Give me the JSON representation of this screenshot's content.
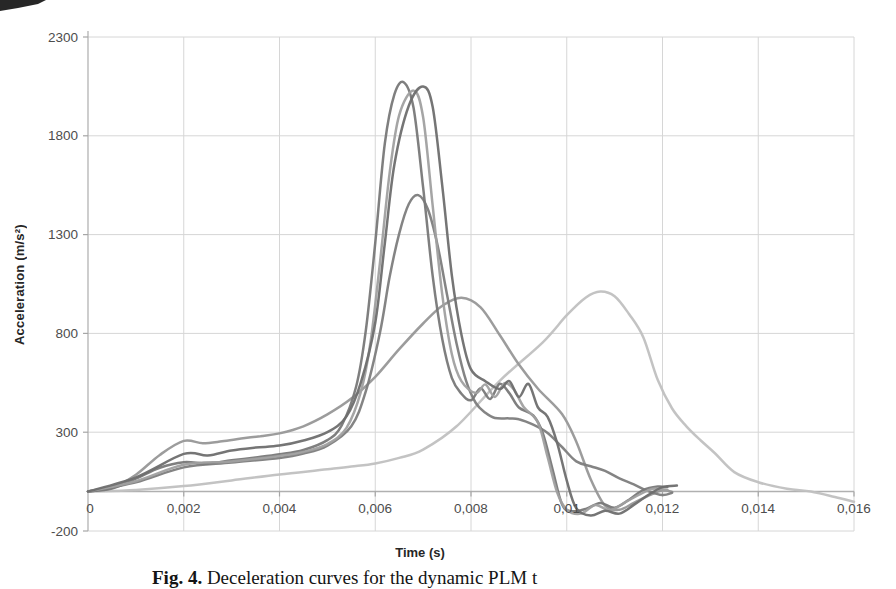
{
  "colors": {
    "background": "#ffffff",
    "grid": "#d6d6d6",
    "axis_line": "#b3b3b3",
    "zero_line": "#b0b0b0",
    "tick_mark": "#a6a6a6",
    "tick_text": "#4d4d4d",
    "axis_title_text": "#262626",
    "caption_text": "#141414",
    "scan_artifact": "#151515"
  },
  "caption": {
    "prefix": "Fig. 4.",
    "text": " Deceleration curves for the dynamic PLM t"
  },
  "chart_data": {
    "type": "line",
    "title": "",
    "xlabel": "Time (s)",
    "ylabel": "Acceleration (m/s²)",
    "xlim": [
      0,
      0.016
    ],
    "ylim": [
      -200,
      2300
    ],
    "grid": true,
    "legend": "none",
    "x_ticks": [
      {
        "value": 0,
        "label": "0"
      },
      {
        "value": 0.002,
        "label": "0,002"
      },
      {
        "value": 0.004,
        "label": "0,004"
      },
      {
        "value": 0.006,
        "label": "0,006"
      },
      {
        "value": 0.008,
        "label": "0,008"
      },
      {
        "value": 0.01,
        "label": "0,01"
      },
      {
        "value": 0.012,
        "label": "0,012"
      },
      {
        "value": 0.014,
        "label": "0,014"
      },
      {
        "value": 0.016,
        "label": "0,016"
      }
    ],
    "y_ticks": [
      {
        "value": -200,
        "label": "-200"
      },
      {
        "value": 300,
        "label": "300"
      },
      {
        "value": 800,
        "label": "800"
      },
      {
        "value": 1300,
        "label": "1300"
      },
      {
        "value": 1800,
        "label": "1800"
      },
      {
        "value": 2300,
        "label": "2300"
      }
    ],
    "series": [
      {
        "name": "curve-6-light-broad",
        "color": "#c0c0c0",
        "points": [
          [
            0,
            0
          ],
          [
            0.001,
            8
          ],
          [
            0.002,
            27
          ],
          [
            0.003,
            56
          ],
          [
            0.004,
            86
          ],
          [
            0.005,
            112
          ],
          [
            0.0055,
            126
          ],
          [
            0.006,
            142
          ],
          [
            0.0065,
            170
          ],
          [
            0.007,
            212
          ],
          [
            0.0077,
            330
          ],
          [
            0.0086,
            560
          ],
          [
            0.0095,
            755
          ],
          [
            0.01,
            892
          ],
          [
            0.0104,
            982
          ],
          [
            0.0107,
            1012
          ],
          [
            0.011,
            988
          ],
          [
            0.0113,
            898
          ],
          [
            0.0116,
            780
          ],
          [
            0.0119,
            565
          ],
          [
            0.0122,
            420
          ],
          [
            0.0125,
            330
          ],
          [
            0.0128,
            258
          ],
          [
            0.0131,
            192
          ],
          [
            0.0135,
            98
          ],
          [
            0.014,
            47
          ],
          [
            0.0146,
            14
          ],
          [
            0.0151,
            0
          ],
          [
            0.0156,
            -28
          ],
          [
            0.016,
            -52
          ]
        ]
      },
      {
        "name": "curve-5-medium-broad",
        "color": "#979797",
        "points": [
          [
            0,
            0
          ],
          [
            0.0005,
            18
          ],
          [
            0.001,
            85
          ],
          [
            0.0015,
            185
          ],
          [
            0.002,
            256
          ],
          [
            0.0024,
            244
          ],
          [
            0.0028,
            254
          ],
          [
            0.0032,
            268
          ],
          [
            0.0036,
            280
          ],
          [
            0.004,
            294
          ],
          [
            0.0045,
            330
          ],
          [
            0.005,
            390
          ],
          [
            0.0055,
            470
          ],
          [
            0.006,
            580
          ],
          [
            0.0065,
            720
          ],
          [
            0.007,
            850
          ],
          [
            0.0074,
            940
          ],
          [
            0.0078,
            980
          ],
          [
            0.0082,
            932
          ],
          [
            0.0086,
            792
          ],
          [
            0.009,
            642
          ],
          [
            0.0094,
            520
          ],
          [
            0.0099,
            392
          ],
          [
            0.0102,
            252
          ],
          [
            0.0105,
            62
          ],
          [
            0.0108,
            -72
          ],
          [
            0.0111,
            -92
          ],
          [
            0.0114,
            -58
          ],
          [
            0.0117,
            -22
          ],
          [
            0.012,
            6
          ],
          [
            0.0122,
            -2
          ]
        ]
      },
      {
        "name": "curve-4-dark-1500",
        "color": "#7d7d7d",
        "points": [
          [
            0,
            0
          ],
          [
            0.001,
            46
          ],
          [
            0.002,
            122
          ],
          [
            0.003,
            146
          ],
          [
            0.004,
            170
          ],
          [
            0.0045,
            192
          ],
          [
            0.005,
            232
          ],
          [
            0.0055,
            330
          ],
          [
            0.0058,
            505
          ],
          [
            0.0061,
            805
          ],
          [
            0.0063,
            1085
          ],
          [
            0.0065,
            1305
          ],
          [
            0.0067,
            1455
          ],
          [
            0.0069,
            1500
          ],
          [
            0.0071,
            1428
          ],
          [
            0.0073,
            1248
          ],
          [
            0.0075,
            995
          ],
          [
            0.0077,
            748
          ],
          [
            0.0079,
            558
          ],
          [
            0.0081,
            448
          ],
          [
            0.0083,
            398
          ],
          [
            0.0085,
            372
          ],
          [
            0.0088,
            370
          ],
          [
            0.009,
            366
          ],
          [
            0.0093,
            338
          ],
          [
            0.0096,
            296
          ],
          [
            0.0099,
            225
          ],
          [
            0.0102,
            152
          ],
          [
            0.0105,
            128
          ],
          [
            0.0108,
            104
          ],
          [
            0.0111,
            66
          ],
          [
            0.0114,
            36
          ],
          [
            0.0117,
            2
          ],
          [
            0.012,
            -18
          ],
          [
            0.0122,
            -6
          ]
        ]
      },
      {
        "name": "curve-1-dark-2070",
        "color": "#787878",
        "points": [
          [
            0,
            0
          ],
          [
            0.0005,
            15
          ],
          [
            0.001,
            65
          ],
          [
            0.0015,
            120
          ],
          [
            0.002,
            148
          ],
          [
            0.0025,
            142
          ],
          [
            0.003,
            158
          ],
          [
            0.0035,
            172
          ],
          [
            0.004,
            188
          ],
          [
            0.0045,
            210
          ],
          [
            0.005,
            260
          ],
          [
            0.0053,
            335
          ],
          [
            0.0056,
            530
          ],
          [
            0.0058,
            810
          ],
          [
            0.006,
            1260
          ],
          [
            0.0062,
            1760
          ],
          [
            0.0064,
            2010
          ],
          [
            0.0066,
            2070
          ],
          [
            0.0068,
            1940
          ],
          [
            0.007,
            1540
          ],
          [
            0.0072,
            1090
          ],
          [
            0.0074,
            770
          ],
          [
            0.0076,
            575
          ],
          [
            0.0078,
            495
          ],
          [
            0.008,
            462
          ],
          [
            0.0082,
            522
          ],
          [
            0.0084,
            468
          ],
          [
            0.0086,
            545
          ],
          [
            0.0088,
            498
          ],
          [
            0.009,
            425
          ],
          [
            0.0093,
            385
          ],
          [
            0.0095,
            295
          ],
          [
            0.0097,
            115
          ],
          [
            0.0099,
            -65
          ],
          [
            0.0101,
            -100
          ],
          [
            0.0104,
            -88
          ],
          [
            0.0107,
            -58
          ],
          [
            0.011,
            -82
          ],
          [
            0.0113,
            -42
          ],
          [
            0.0116,
            8
          ],
          [
            0.0119,
            25
          ],
          [
            0.0121,
            22
          ]
        ]
      },
      {
        "name": "curve-2-medium-2030",
        "color": "#a0a0a0",
        "points": [
          [
            0,
            0
          ],
          [
            0.001,
            52
          ],
          [
            0.002,
            135
          ],
          [
            0.003,
            152
          ],
          [
            0.004,
            180
          ],
          [
            0.0045,
            200
          ],
          [
            0.005,
            240
          ],
          [
            0.0054,
            322
          ],
          [
            0.0057,
            505
          ],
          [
            0.0059,
            755
          ],
          [
            0.0061,
            1160
          ],
          [
            0.0063,
            1610
          ],
          [
            0.0065,
            1905
          ],
          [
            0.0068,
            2030
          ],
          [
            0.007,
            1895
          ],
          [
            0.0072,
            1445
          ],
          [
            0.0074,
            995
          ],
          [
            0.0076,
            695
          ],
          [
            0.0078,
            558
          ],
          [
            0.0081,
            498
          ],
          [
            0.0083,
            542
          ],
          [
            0.0085,
            478
          ],
          [
            0.0087,
            548
          ],
          [
            0.0089,
            515
          ],
          [
            0.0091,
            428
          ],
          [
            0.0094,
            348
          ],
          [
            0.0096,
            175
          ],
          [
            0.0098,
            -5
          ],
          [
            0.01,
            -92
          ],
          [
            0.0103,
            -112
          ],
          [
            0.0106,
            -68
          ],
          [
            0.0109,
            -96
          ],
          [
            0.0112,
            -58
          ],
          [
            0.0115,
            -18
          ],
          [
            0.0118,
            14
          ],
          [
            0.0121,
            8
          ]
        ]
      },
      {
        "name": "curve-3-dark-2050",
        "color": "#6e6e6e",
        "points": [
          [
            0,
            0
          ],
          [
            0.001,
            72
          ],
          [
            0.002,
            190
          ],
          [
            0.0025,
            182
          ],
          [
            0.003,
            208
          ],
          [
            0.0035,
            222
          ],
          [
            0.004,
            232
          ],
          [
            0.0045,
            258
          ],
          [
            0.005,
            300
          ],
          [
            0.0054,
            380
          ],
          [
            0.0057,
            552
          ],
          [
            0.006,
            855
          ],
          [
            0.0062,
            1255
          ],
          [
            0.0064,
            1655
          ],
          [
            0.0067,
            1952
          ],
          [
            0.007,
            2050
          ],
          [
            0.0072,
            1945
          ],
          [
            0.0074,
            1545
          ],
          [
            0.0076,
            1095
          ],
          [
            0.0078,
            795
          ],
          [
            0.008,
            618
          ],
          [
            0.0083,
            558
          ],
          [
            0.0086,
            518
          ],
          [
            0.0088,
            558
          ],
          [
            0.009,
            478
          ],
          [
            0.0092,
            545
          ],
          [
            0.0094,
            425
          ],
          [
            0.0096,
            378
          ],
          [
            0.0098,
            245
          ],
          [
            0.01,
            55
          ],
          [
            0.0102,
            -85
          ],
          [
            0.0105,
            -122
          ],
          [
            0.0108,
            -98
          ],
          [
            0.0111,
            -112
          ],
          [
            0.0114,
            -68
          ],
          [
            0.0117,
            -18
          ],
          [
            0.012,
            22
          ],
          [
            0.0123,
            30
          ]
        ]
      }
    ]
  }
}
